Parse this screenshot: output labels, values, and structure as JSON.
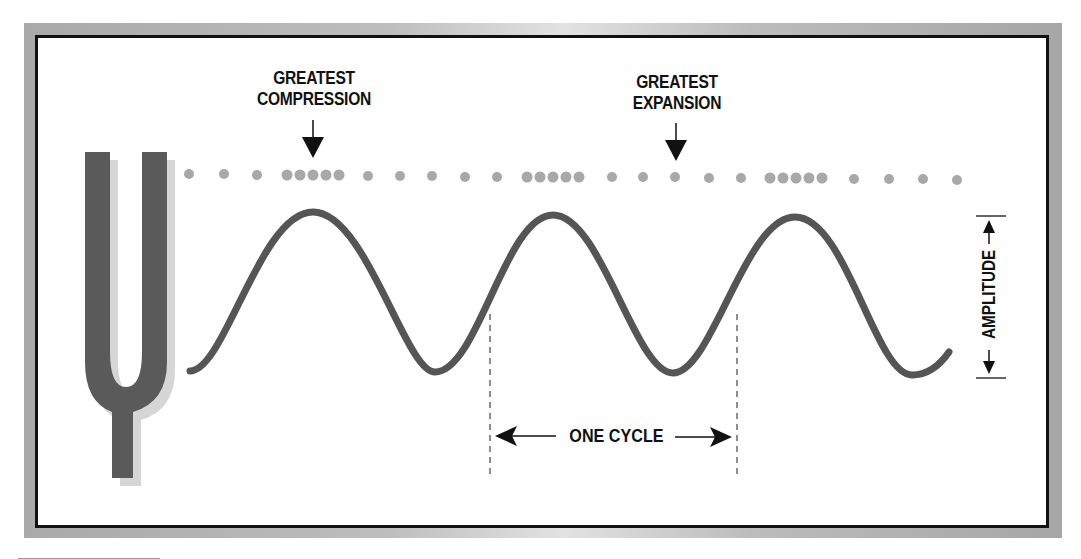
{
  "diagram": {
    "labels": {
      "compression": [
        "GREATEST",
        "COMPRESSION"
      ],
      "expansion": [
        "GREATEST",
        "EXPANSION"
      ],
      "amplitude": "AMPLITUDE",
      "cycle": "ONE CYCLE"
    },
    "icons": {
      "source": "tuning-fork-icon",
      "compression_pointer": "arrow-down-icon",
      "expansion_pointer": "arrow-down-icon",
      "amplitude_indicator": "double-arrow-vertical-icon",
      "cycle_indicator": "double-arrow-horizontal-icon"
    },
    "colors": {
      "wave": "#555555",
      "particles": "#a8a8a8",
      "fork": "#5a5a5a",
      "fork_shadow": "#d4d4d4",
      "frame_border": "#111111",
      "frame_bevel": "#b5b5b5",
      "text": "#111111"
    },
    "particle_row": {
      "pattern": "sparse-then-dense clusters of 5 (compressions) alternating with evenly spaced dots (rarefactions)",
      "compression_clusters": 3
    },
    "wave": {
      "cycles_shown": 2.5,
      "crests": 3,
      "troughs": 3
    }
  }
}
